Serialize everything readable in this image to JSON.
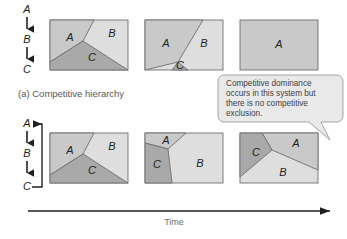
{
  "figure": {
    "caption_a": "(a) Competitive hierarchy",
    "axis_label": "Time",
    "colors": {
      "species_a": "#c9c9c9",
      "species_b": "#dedede",
      "species_c": "#a9a9a9",
      "outline": "#6f6f6f",
      "arrow": "#231f20",
      "callout_fill": "#e9e9e9",
      "callout_stroke": "#9a9a9a",
      "text": "#231f20",
      "caption": "#58595b"
    }
  },
  "hierarchy_top": {
    "name": "linear-hierarchy",
    "nodes": [
      "A",
      "B",
      "C"
    ],
    "arrows": [
      "down",
      "down"
    ],
    "cyclic": false
  },
  "hierarchy_bottom": {
    "name": "cyclic-hierarchy",
    "nodes": [
      "A",
      "B",
      "C"
    ],
    "arrows": [
      "down",
      "down"
    ],
    "cyclic": true,
    "loop_arrow_target": "A"
  },
  "callout": {
    "lines": [
      "Competitive dominance",
      "occurs in this system but",
      "there is no competitive",
      "exclusion."
    ],
    "text": "Competitive dominance occurs in this system but there is no competitive exclusion."
  },
  "panels_top": [
    {
      "index": 1,
      "name": "panel-top-1",
      "regions": [
        {
          "species": "A",
          "label": "A"
        },
        {
          "species": "B",
          "label": "B"
        },
        {
          "species": "C",
          "label": "C"
        }
      ]
    },
    {
      "index": 2,
      "name": "panel-top-2",
      "regions": [
        {
          "species": "A",
          "label": "A"
        },
        {
          "species": "B",
          "label": "B"
        },
        {
          "species": "C",
          "label": "C"
        }
      ]
    },
    {
      "index": 3,
      "name": "panel-top-3",
      "regions": [
        {
          "species": "A",
          "label": "A"
        }
      ]
    }
  ],
  "panels_bottom": [
    {
      "index": 1,
      "name": "panel-bottom-1",
      "regions": [
        {
          "species": "A",
          "label": "A"
        },
        {
          "species": "B",
          "label": "B"
        },
        {
          "species": "C",
          "label": "C"
        }
      ]
    },
    {
      "index": 2,
      "name": "panel-bottom-2",
      "regions": [
        {
          "species": "A",
          "label": "A"
        },
        {
          "species": "B",
          "label": "B"
        },
        {
          "species": "C",
          "label": "C"
        }
      ]
    },
    {
      "index": 3,
      "name": "panel-bottom-3",
      "regions": [
        {
          "species": "A",
          "label": "A"
        },
        {
          "species": "B",
          "label": "B"
        },
        {
          "species": "C",
          "label": "C"
        }
      ]
    }
  ]
}
